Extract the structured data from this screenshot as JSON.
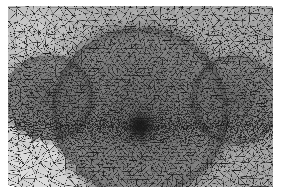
{
  "figure": {
    "type": "mesh-visualization",
    "background_color": "#ffffff",
    "edge_color": "#1a1a1a",
    "canvas": {
      "width": 282,
      "height": 193,
      "plot_left": 8,
      "plot_top": 6,
      "plot_right": 273,
      "plot_bottom": 187
    }
  },
  "chart_data": {
    "type": "heatmap",
    "xlabel": "",
    "ylabel": "",
    "grid": false,
    "legend": "none",
    "xlim": [
      8,
      273
    ],
    "ylim": [
      6,
      187
    ],
    "regions": [
      {
        "name": "far-field-background",
        "shade": "light",
        "fill": "#b9b9b9",
        "density": 1.0,
        "base_edge_length": 7.4
      },
      {
        "name": "central-dome",
        "shape": "ellipse",
        "cx": 140,
        "cy": 112,
        "rx": 88,
        "ry": 84,
        "shade": "dark",
        "fill": "#5e5e5e",
        "density": 2.3,
        "base_edge_length": 3.2
      },
      {
        "name": "left-lobe",
        "shape": "ellipse",
        "cx": 48,
        "cy": 98,
        "rx": 44,
        "ry": 42,
        "shade": "dark",
        "fill": "#4a4a4a",
        "density": 2.0
      },
      {
        "name": "right-lobe",
        "shape": "ellipse",
        "cx": 236,
        "cy": 100,
        "rx": 44,
        "ry": 44,
        "shade": "dark",
        "fill": "#4a4a4a",
        "density": 2.0
      },
      {
        "name": "central-singularity",
        "shape": "point",
        "cx": 140,
        "cy": 126,
        "radius": 11,
        "shade": "very-dark",
        "fill": "#1e1e1e",
        "density": 6.0,
        "min_edge_length": 0.7
      },
      {
        "name": "coarse-corner-bottom-left",
        "cx": 22,
        "cy": 172,
        "shade": "lightest",
        "fill": "#cfcfcf",
        "density": 0.55,
        "base_edge_length": 12.5
      },
      {
        "name": "coarse-corner-top-left",
        "cx": 24,
        "cy": 22,
        "shade": "lighter",
        "fill": "#c6c6c6",
        "density": 0.75,
        "base_edge_length": 9.5
      }
    ],
    "grading": {
      "refinement_center": [
        140,
        126
      ],
      "max_density_ratio": 11.0,
      "element_count_estimate": 18400,
      "node_count_estimate": 9350
    }
  }
}
